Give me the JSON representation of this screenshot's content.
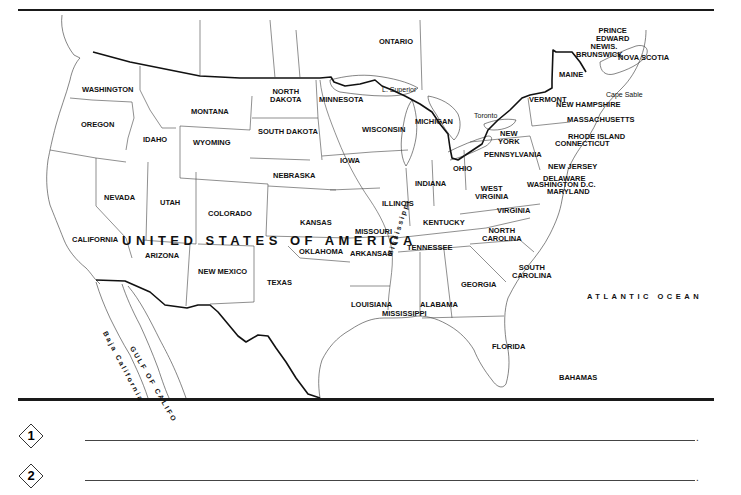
{
  "map": {
    "title": "UNITED STATES OF AMERICA",
    "ocean": "ATLANTIC OCEAN",
    "labels": [
      {
        "id": "ontario",
        "text": "ONTARIO",
        "x": 379,
        "y": 38
      },
      {
        "id": "prince-edward",
        "text": "PRINCE\nEDWARD\nIS.",
        "x": 596,
        "y": 27
      },
      {
        "id": "new-brunswick",
        "text": "NEW\nBRUNSWICK",
        "x": 576,
        "y": 43
      },
      {
        "id": "nova-scotia",
        "text": "NOVA SCOTIA",
        "x": 618,
        "y": 54
      },
      {
        "id": "maine",
        "text": "MAINE",
        "x": 559,
        "y": 71
      },
      {
        "id": "cape-sable",
        "text": "Cape Sable",
        "x": 606,
        "y": 91
      },
      {
        "id": "vermont",
        "text": "VERMONT",
        "x": 529,
        "y": 96
      },
      {
        "id": "new-hampshire",
        "text": "NEW HAMPSHIRE",
        "x": 556,
        "y": 101
      },
      {
        "id": "massachusetts",
        "text": "MASSACHUSETTS",
        "x": 567,
        "y": 116
      },
      {
        "id": "rhode-island",
        "text": "RHODE ISLAND",
        "x": 568,
        "y": 133
      },
      {
        "id": "connecticut",
        "text": "CONNECTICUT",
        "x": 555,
        "y": 140
      },
      {
        "id": "washington",
        "text": "WASHINGTON",
        "x": 82,
        "y": 86
      },
      {
        "id": "north-dakota",
        "text": "NORTH\nDAKOTA",
        "x": 270,
        "y": 88
      },
      {
        "id": "minnesota",
        "text": "MINNESOTA",
        "x": 319,
        "y": 96
      },
      {
        "id": "l-superior",
        "text": "L. Superior",
        "x": 382,
        "y": 86
      },
      {
        "id": "montana",
        "text": "MONTANA",
        "x": 191,
        "y": 108
      },
      {
        "id": "oregon",
        "text": "OREGON",
        "x": 81,
        "y": 121
      },
      {
        "id": "south-dakota",
        "text": "SOUTH DAKOTA",
        "x": 258,
        "y": 128
      },
      {
        "id": "wisconsin",
        "text": "WISCONSIN",
        "x": 362,
        "y": 126
      },
      {
        "id": "michigan",
        "text": "MICHIGAN",
        "x": 415,
        "y": 118
      },
      {
        "id": "toronto",
        "text": "Toronto",
        "x": 474,
        "y": 112
      },
      {
        "id": "new-york",
        "text": "NEW\nYORK",
        "x": 498,
        "y": 130
      },
      {
        "id": "idaho",
        "text": "IDAHO",
        "x": 143,
        "y": 136
      },
      {
        "id": "wyoming",
        "text": "WYOMING",
        "x": 193,
        "y": 139
      },
      {
        "id": "pennsylvania",
        "text": "PENNSYLVANIA",
        "x": 484,
        "y": 151
      },
      {
        "id": "iowa",
        "text": "IOWA",
        "x": 340,
        "y": 157
      },
      {
        "id": "new-jersey",
        "text": "NEW JERSEY",
        "x": 548,
        "y": 163
      },
      {
        "id": "ohio",
        "text": "OHIO",
        "x": 453,
        "y": 165
      },
      {
        "id": "nebraska",
        "text": "NEBRASKA",
        "x": 273,
        "y": 172
      },
      {
        "id": "delaware",
        "text": "DELAWARE",
        "x": 543,
        "y": 175
      },
      {
        "id": "washington-dc",
        "text": "WASHINGTON D.C.",
        "x": 527,
        "y": 181
      },
      {
        "id": "maryland",
        "text": "MARYLAND",
        "x": 547,
        "y": 188
      },
      {
        "id": "indiana",
        "text": "INDIANA",
        "x": 415,
        "y": 180
      },
      {
        "id": "west-virginia",
        "text": "WEST\nVIRGINIA",
        "x": 475,
        "y": 185
      },
      {
        "id": "nevada",
        "text": "NEVADA",
        "x": 104,
        "y": 194
      },
      {
        "id": "utah",
        "text": "UTAH",
        "x": 160,
        "y": 199
      },
      {
        "id": "illinois",
        "text": "ILLINOIS",
        "x": 382,
        "y": 200
      },
      {
        "id": "colorado",
        "text": "COLORADO",
        "x": 208,
        "y": 210
      },
      {
        "id": "virginia",
        "text": "VIRGINIA",
        "x": 497,
        "y": 207
      },
      {
        "id": "kentucky",
        "text": "KENTUCKY",
        "x": 423,
        "y": 219
      },
      {
        "id": "kansas",
        "text": "KANSAS",
        "x": 300,
        "y": 219
      },
      {
        "id": "missouri",
        "text": "MISSOURI",
        "x": 355,
        "y": 228
      },
      {
        "id": "north-carolina",
        "text": "NORTH\nCAROLINA",
        "x": 482,
        "y": 227
      },
      {
        "id": "california",
        "text": "CALIFORNIA",
        "x": 72,
        "y": 236
      },
      {
        "id": "tennessee",
        "text": "TENNESSEE",
        "x": 407,
        "y": 244
      },
      {
        "id": "arizona",
        "text": "ARIZONA",
        "x": 145,
        "y": 252
      },
      {
        "id": "oklahoma",
        "text": "OKLAHOMA",
        "x": 299,
        "y": 248
      },
      {
        "id": "arkansas",
        "text": "ARKANSAS",
        "x": 350,
        "y": 250
      },
      {
        "id": "new-mexico",
        "text": "NEW MEXICO",
        "x": 198,
        "y": 268
      },
      {
        "id": "south-carolina",
        "text": "SOUTH\nCAROLINA",
        "x": 512,
        "y": 264
      },
      {
        "id": "texas",
        "text": "TEXAS",
        "x": 267,
        "y": 279
      },
      {
        "id": "georgia",
        "text": "GEORGIA",
        "x": 461,
        "y": 281
      },
      {
        "id": "louisiana",
        "text": "LOUISIANA",
        "x": 351,
        "y": 301
      },
      {
        "id": "alabama",
        "text": "ALABAMA",
        "x": 420,
        "y": 301
      },
      {
        "id": "mississippi",
        "text": "MISSISSIPPI",
        "x": 382,
        "y": 310
      },
      {
        "id": "florida",
        "text": "FLORIDA",
        "x": 492,
        "y": 343
      },
      {
        "id": "bahamas",
        "text": "BAHAMAS",
        "x": 559,
        "y": 374
      }
    ],
    "rotated_labels": [
      {
        "id": "mississippi-river",
        "text": "Mississippi",
        "x": 386,
        "y": 255,
        "rotate": -72
      },
      {
        "id": "baja-california",
        "text": "Baja California",
        "x": 108,
        "y": 330,
        "rotate": 62
      },
      {
        "id": "gulf-of-california",
        "text": "GULF OF CALIFO",
        "x": 135,
        "y": 345,
        "rotate": 60
      }
    ]
  },
  "answers": [
    {
      "number": "1",
      "period": "."
    },
    {
      "number": "2",
      "period": "."
    }
  ]
}
